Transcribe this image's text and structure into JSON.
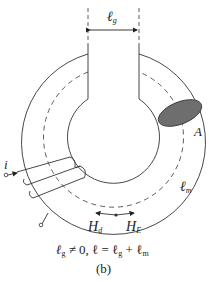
{
  "diagram": {
    "type": "toroidal core with air gap",
    "labels": {
      "gap_length": "ℓ",
      "gap_length_sub": "g",
      "area": "A",
      "mean_path": "ℓ",
      "mean_path_sub": "m",
      "current": "i",
      "field_d": "H",
      "field_d_sub": "d",
      "field_e": "H",
      "field_e_sub": "E"
    },
    "equation": "ℓg ≠ 0, ℓ = ℓg + ℓm",
    "equation_parts": {
      "a": "ℓ",
      "a_sub": "g",
      "b": " ≠ 0, ℓ = ℓ",
      "b_sub": "g",
      "c": " + ℓ",
      "c_sub": "m"
    },
    "caption": "(b)",
    "colors": {
      "stroke": "#333333",
      "cross_section_fill": "#6e6e6e"
    }
  }
}
